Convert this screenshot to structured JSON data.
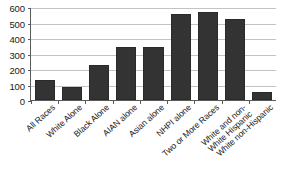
{
  "chart_data": {
    "type": "bar",
    "title": "",
    "subtitle": "",
    "xlabel": "",
    "ylabel": "",
    "ylim": [
      0,
      600
    ],
    "yticks": [
      0,
      100,
      200,
      300,
      400,
      500,
      600
    ],
    "grid": true,
    "legend": false,
    "legend_position": "none",
    "bar_color": "#333333",
    "gridline_color": "#c3c3c3",
    "axis_color": "#5a5a5a",
    "background_color": "#ffffff",
    "categories": [
      "All Races",
      "White Alone",
      "Black Alone",
      "AIAN alone",
      "Asian alone",
      "NHPI alone",
      "Two or More Races",
      "White and non-White Hispanic",
      "White non-Hispanic"
    ],
    "category_lines": [
      [
        "All Races"
      ],
      [
        "White Alone"
      ],
      [
        "Black Alone"
      ],
      [
        "AIAN alone"
      ],
      [
        "Asian alone"
      ],
      [
        "NHPI alone"
      ],
      [
        "Two or More Races"
      ],
      [
        "White and non-",
        "White Hispanic"
      ],
      [
        "White non-Hispanic"
      ]
    ],
    "values": [
      130,
      85,
      225,
      345,
      345,
      555,
      570,
      520,
      50
    ]
  }
}
